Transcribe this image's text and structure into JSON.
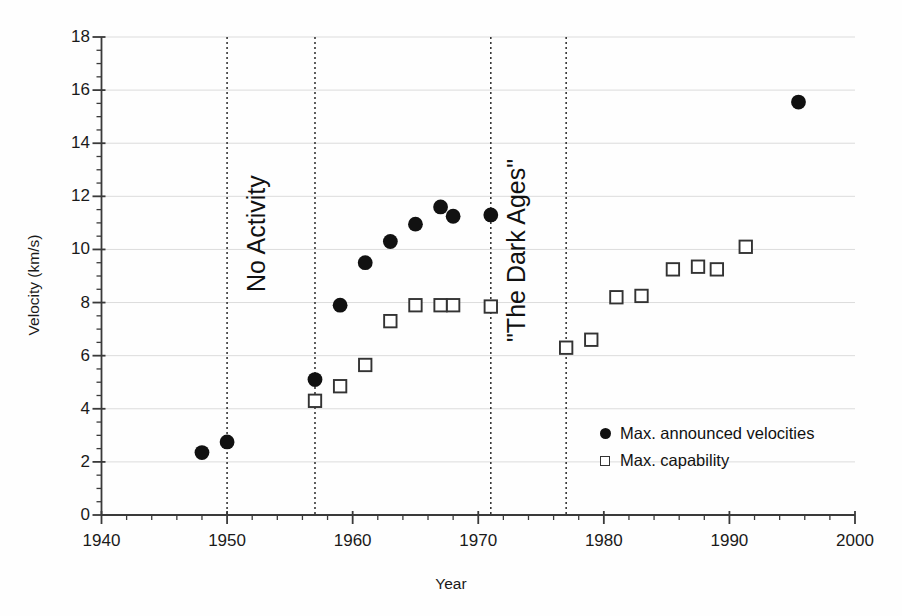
{
  "figure": {
    "background": "#fefefe",
    "marker_fill_color": "#111111",
    "marker_open_color": "#333333",
    "axis_color": "#3a3a3a",
    "gridline_color": "#dcdcdc"
  },
  "axes": {
    "xlabel": "Year",
    "ylabel": "Velocity (km/s)",
    "x_ticks": [
      "1940",
      "1950",
      "1960",
      "1970",
      "1980",
      "1990",
      "2000"
    ],
    "y_ticks": [
      "0",
      "2",
      "4",
      "6",
      "8",
      "10",
      "12",
      "14",
      "16",
      "18"
    ]
  },
  "legend": {
    "entries": [
      {
        "marker": "filled-circle",
        "label": "Max. announced velocities"
      },
      {
        "marker": "open-square",
        "label": "Max. capability"
      }
    ]
  },
  "annotations": [
    {
      "text": "No Activity",
      "rotation": -90
    },
    {
      "text": "\"The Dark Ages\"",
      "rotation": -90
    }
  ],
  "chart_data": {
    "type": "scatter",
    "title": "",
    "xlabel": "Year",
    "ylabel": "Velocity (km/s)",
    "xlim": [
      1940,
      2000
    ],
    "ylim": [
      0,
      18
    ],
    "x_major_tick_step": 10,
    "x_minor_tick_step": 2,
    "y_major_tick_step": 2,
    "y_minor_tick_step": 0.5,
    "grid": "horizontal-major-light",
    "legend_position": "lower-right-inside",
    "series": [
      {
        "name": "Max. announced velocities",
        "marker": "filled-circle",
        "color": "#111111",
        "points": [
          {
            "x": 1948,
            "y": 2.35
          },
          {
            "x": 1950,
            "y": 2.75
          },
          {
            "x": 1957,
            "y": 5.1
          },
          {
            "x": 1959,
            "y": 7.9
          },
          {
            "x": 1961,
            "y": 9.5
          },
          {
            "x": 1963,
            "y": 10.3
          },
          {
            "x": 1965,
            "y": 10.95
          },
          {
            "x": 1967,
            "y": 11.6
          },
          {
            "x": 1968,
            "y": 11.25
          },
          {
            "x": 1971,
            "y": 11.3
          },
          {
            "x": 1995.5,
            "y": 15.55
          }
        ]
      },
      {
        "name": "Max. capability",
        "marker": "open-square",
        "color": "#333333",
        "points": [
          {
            "x": 1957,
            "y": 4.3
          },
          {
            "x": 1959,
            "y": 4.85
          },
          {
            "x": 1961,
            "y": 5.65
          },
          {
            "x": 1963,
            "y": 7.3
          },
          {
            "x": 1965,
            "y": 7.9
          },
          {
            "x": 1967,
            "y": 7.9
          },
          {
            "x": 1968,
            "y": 7.9
          },
          {
            "x": 1971,
            "y": 7.85
          },
          {
            "x": 1977,
            "y": 6.3
          },
          {
            "x": 1979,
            "y": 6.6
          },
          {
            "x": 1981,
            "y": 8.2
          },
          {
            "x": 1983,
            "y": 8.25
          },
          {
            "x": 1985.5,
            "y": 9.25
          },
          {
            "x": 1987.5,
            "y": 9.35
          },
          {
            "x": 1989,
            "y": 9.25
          },
          {
            "x": 1991.3,
            "y": 10.1
          }
        ]
      }
    ],
    "vertical_reference_lines": [
      {
        "x": 1950,
        "style": "dotted"
      },
      {
        "x": 1957,
        "style": "dotted"
      },
      {
        "x": 1971,
        "style": "dotted"
      },
      {
        "x": 1977,
        "style": "dotted"
      }
    ],
    "annotations": [
      {
        "text": "No Activity",
        "x": 1953.5,
        "y": 9.5,
        "rotation": -90
      },
      {
        "text": "\"The Dark Ages\"",
        "x": 1974.2,
        "y": 7.6,
        "rotation": -90
      }
    ]
  }
}
